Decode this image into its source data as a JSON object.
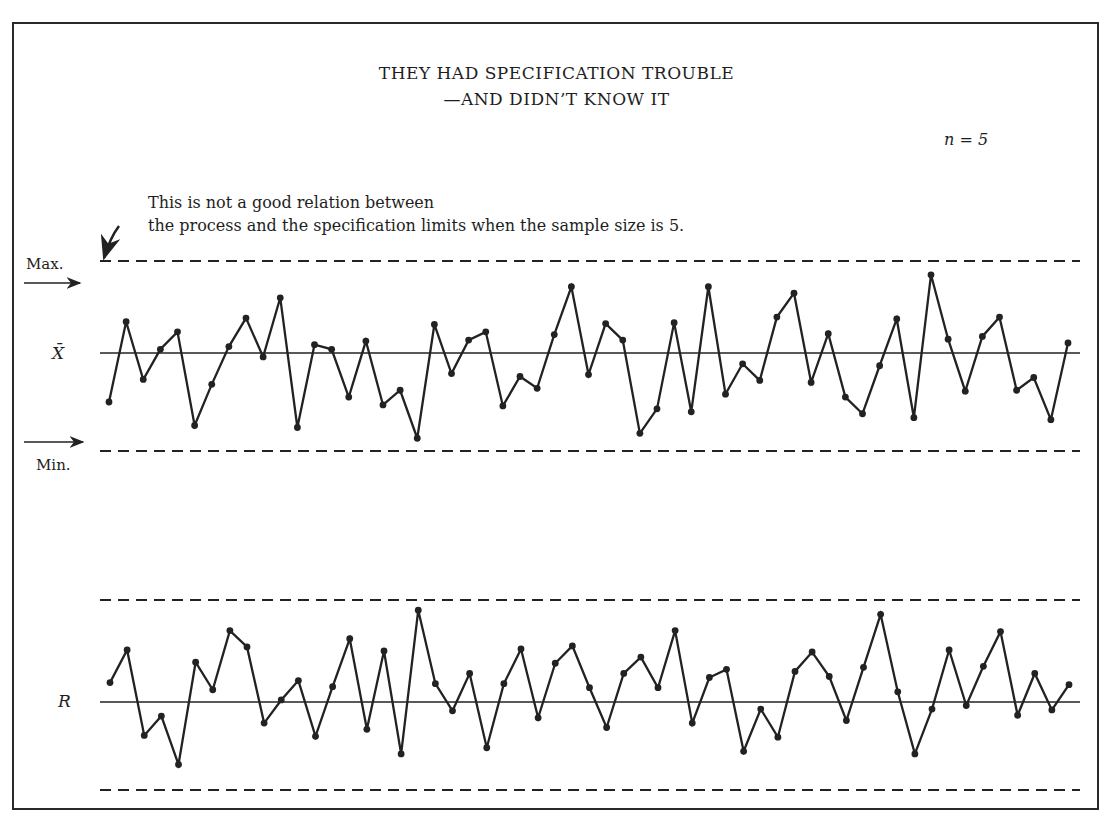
{
  "figure": {
    "title_line1": "THEY HAD SPECIFICATION TROUBLE",
    "title_line2": "—AND DIDN’T KNOW IT",
    "sample_size_label": "n = 5",
    "annotation_line1": "This is not a good relation between",
    "annotation_line2": "the process and the specification limits when the sample size is 5.",
    "max_label": "Max.",
    "min_label": "Min.",
    "xbar_label": "X̄",
    "r_label": "R"
  },
  "chart_data": [
    {
      "type": "line",
      "title": "X-bar chart vs. specification limits",
      "ylabel": "X̄",
      "grid": false,
      "reference_lines": [
        {
          "name": "Max. (specification limit)",
          "style": "dashed",
          "y": 1.0
        },
        {
          "name": "Center line (grand mean)",
          "style": "solid",
          "y": 0.0
        },
        {
          "name": "Min. (specification limit)",
          "style": "dashed",
          "y": -1.0
        }
      ],
      "x": [
        1,
        2,
        3,
        4,
        5,
        6,
        7,
        8,
        9,
        10,
        11,
        12,
        13,
        14,
        15,
        16,
        17,
        18,
        19,
        20,
        21,
        22,
        23,
        24,
        25,
        26,
        27,
        28,
        29,
        30,
        31,
        32,
        33,
        34,
        35,
        36,
        37,
        38,
        39,
        40,
        41,
        42,
        43,
        44,
        45,
        46,
        47,
        48,
        49,
        50,
        51,
        52,
        53,
        54,
        55,
        56,
        57,
        58
      ],
      "values": [
        -0.5,
        0.34,
        -0.27,
        0.04,
        0.23,
        -0.74,
        -0.32,
        0.07,
        0.38,
        -0.04,
        0.6,
        -0.76,
        0.09,
        0.04,
        -0.45,
        0.13,
        -0.53,
        -0.38,
        -0.87,
        0.31,
        -0.21,
        0.14,
        0.23,
        -0.54,
        -0.24,
        -0.36,
        0.2,
        0.72,
        -0.22,
        0.32,
        0.14,
        -0.82,
        -0.57,
        0.33,
        -0.6,
        0.72,
        -0.42,
        -0.11,
        -0.28,
        0.39,
        0.65,
        -0.3,
        0.21,
        -0.45,
        -0.62,
        -0.13,
        0.37,
        -0.66,
        0.85,
        0.15,
        -0.39,
        0.18,
        0.39,
        -0.38,
        -0.25,
        -0.68,
        0.11
      ],
      "ylim": [
        -1.0,
        1.0
      ]
    },
    {
      "type": "line",
      "title": "R chart",
      "ylabel": "R",
      "grid": false,
      "reference_lines": [
        {
          "name": "Upper limit",
          "style": "dashed",
          "y": 1.0
        },
        {
          "name": "Center line",
          "style": "solid",
          "y": 0.0
        },
        {
          "name": "Lower limit",
          "style": "dashed",
          "y": -1.0
        }
      ],
      "x": [
        1,
        2,
        3,
        4,
        5,
        6,
        7,
        8,
        9,
        10,
        11,
        12,
        13,
        14,
        15,
        16,
        17,
        18,
        19,
        20,
        21,
        22,
        23,
        24,
        25,
        26,
        27,
        28,
        29,
        30,
        31,
        32,
        33,
        34,
        35,
        36,
        37,
        38,
        39,
        40,
        41,
        42,
        43,
        44,
        45,
        46,
        47,
        48,
        49,
        50,
        51,
        52,
        53,
        54,
        55,
        56,
        57,
        58
      ],
      "values": [
        0.19,
        0.51,
        -0.38,
        -0.16,
        -0.71,
        0.39,
        0.12,
        0.7,
        0.54,
        -0.24,
        0.02,
        0.21,
        -0.39,
        0.15,
        0.62,
        -0.31,
        0.5,
        -0.59,
        0.9,
        0.18,
        -0.1,
        0.28,
        -0.52,
        0.18,
        0.52,
        -0.18,
        0.38,
        0.55,
        0.14,
        -0.29,
        0.28,
        0.44,
        0.14,
        0.7,
        -0.24,
        0.24,
        0.32,
        -0.56,
        -0.08,
        -0.4,
        0.3,
        0.49,
        0.25,
        -0.21,
        0.34,
        0.86,
        0.1,
        -0.59,
        -0.08,
        0.51,
        -0.04,
        0.35,
        0.69,
        -0.15,
        0.28,
        -0.09,
        0.17
      ],
      "ylim": [
        -1.0,
        1.0
      ]
    }
  ]
}
